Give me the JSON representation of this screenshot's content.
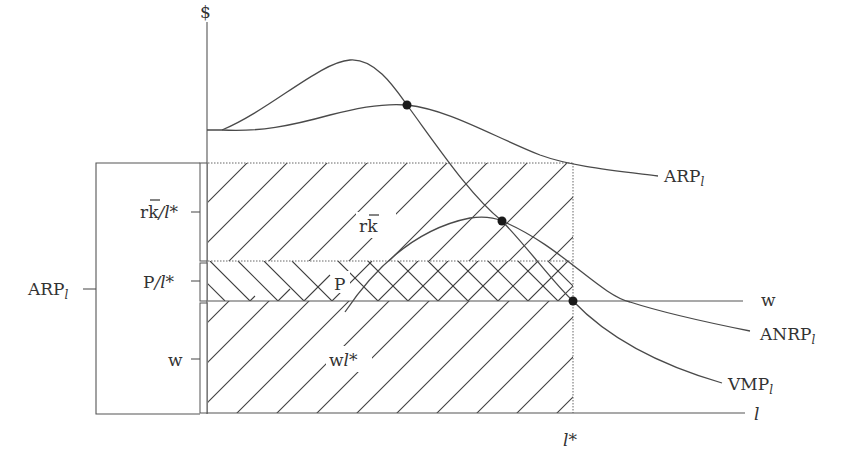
{
  "diagram": {
    "type": "economics-factor-income-distribution",
    "axes": {
      "y_label": "$",
      "x_label": "l",
      "x_marker": "l*"
    },
    "curves": [
      {
        "name": "ARP",
        "subscript": "l",
        "label": "ARP"
      },
      {
        "name": "ANRP",
        "subscript": "l",
        "label": "ANRP"
      },
      {
        "name": "VMP",
        "subscript": "l",
        "label": "VMP"
      },
      {
        "name": "w",
        "label": "w"
      }
    ],
    "regions": [
      {
        "id": "capital",
        "label_main": "rk",
        "bar_over": "k",
        "hatch": "diagonal-forward"
      },
      {
        "id": "profit",
        "label_main": "P",
        "hatch": "chevron"
      },
      {
        "id": "wages",
        "label_main": "w",
        "label_suffix": "l*",
        "hatch": "diagonal-forward"
      }
    ],
    "left_labels": {
      "top": {
        "main": "rk",
        "suffix": "/l*"
      },
      "middle": {
        "main": "P",
        "suffix": "/l*"
      },
      "bottom": {
        "main": "w"
      },
      "bracket": {
        "main": "ARP",
        "subscript": "l"
      }
    },
    "points": [
      {
        "id": "arp-vmp-intersection",
        "x": 407,
        "y": 105
      },
      {
        "id": "anrp-vmp-intersection",
        "x": 502,
        "y": 221
      },
      {
        "id": "w-vmp-intersection",
        "x": 573,
        "y": 301
      }
    ]
  }
}
